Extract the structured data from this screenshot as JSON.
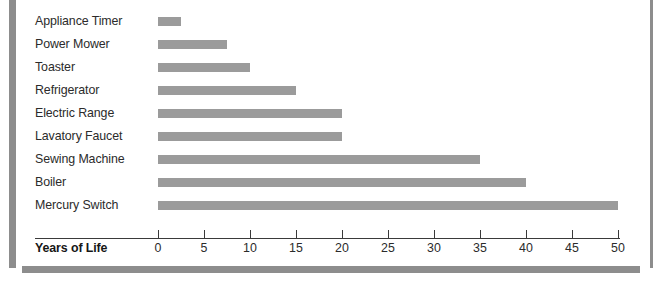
{
  "chart_data": {
    "type": "bar",
    "orientation": "horizontal",
    "title": "",
    "subtitle": "",
    "xlabel": "Years of Life",
    "ylabel": "",
    "categories": [
      "Appliance Timer",
      "Power Mower",
      "Toaster",
      "Refrigerator",
      "Electric Range",
      "Lavatory Faucet",
      "Sewing Machine",
      "Boiler",
      "Mercury Switch"
    ],
    "values": [
      2.5,
      7.5,
      10,
      15,
      20,
      20,
      35,
      40,
      50
    ],
    "xlim": [
      0,
      50
    ],
    "xticks": [
      0,
      5,
      10,
      15,
      20,
      25,
      30,
      35,
      40,
      45,
      50
    ],
    "tick_labels": [
      "0",
      "5",
      "10",
      "15",
      "20",
      "25",
      "30",
      "35",
      "40",
      "45",
      "50"
    ],
    "grid": false,
    "legend": null,
    "bar_color": "#9b9b9b",
    "axis_color": "#3a3a3a",
    "text_color": "#2b2b2b"
  },
  "decor": {
    "rule_color": "#8d8d8d",
    "left_rule_name": "left-vertical-rule",
    "right_rule_name": "right-vertical-rule",
    "bottom_rule_name": "bottom-horizontal-rule"
  }
}
